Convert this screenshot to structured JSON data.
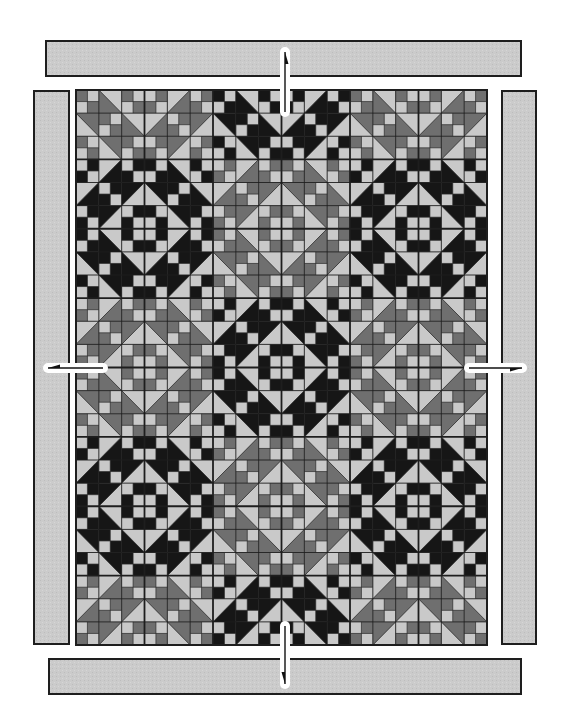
{
  "diagram": {
    "canvas": {
      "width": 575,
      "height": 725
    },
    "colors": {
      "light": "#c9c9c9",
      "medium": "#6f6f6f",
      "dark": "#161616",
      "border_fill": "#cbcbcb",
      "outline": "#1e1e1e",
      "cell_line": "#2a2a2a",
      "background": "#ffffff"
    },
    "quilt_center": {
      "x": 76,
      "y": 90,
      "width": 411,
      "height": 555,
      "blocks_across": 6,
      "blocks_down": 8,
      "cells_per_block": 6,
      "block_type": "chain block: 3x3 units of 2x2 cells; four-patches on even units, half-square triangles on odd units forming a diagonal band",
      "dark_diamond_rule": "corners with odd column index: dark when (cx in {1,5} and cy in {2,6}) or (cx = 3 and cy in {0,4,8}); otherwise medium",
      "dark_diamond_centers": [
        [
          1,
          2
        ],
        [
          5,
          2
        ],
        [
          3,
          4
        ],
        [
          1,
          6
        ],
        [
          5,
          6
        ],
        [
          3,
          0
        ],
        [
          3,
          8
        ]
      ]
    },
    "borders": [
      {
        "name": "top-border",
        "x": 46,
        "y": 41,
        "width": 475,
        "height": 35
      },
      {
        "name": "bottom-border",
        "x": 49,
        "y": 659,
        "width": 472,
        "height": 35
      },
      {
        "name": "left-border",
        "x": 34,
        "y": 91,
        "width": 35,
        "height": 553
      },
      {
        "name": "right-border",
        "x": 502,
        "y": 91,
        "width": 34,
        "height": 553
      }
    ],
    "arrows": [
      {
        "name": "arrow-top-border",
        "direction": "up",
        "x1": 285,
        "y1": 112,
        "x2": 285,
        "y2": 52
      },
      {
        "name": "arrow-bottom-border",
        "direction": "down",
        "x1": 285,
        "y1": 626,
        "x2": 285,
        "y2": 684
      },
      {
        "name": "arrow-left-border",
        "direction": "left",
        "x1": 103,
        "y1": 368,
        "x2": 48,
        "y2": 368
      },
      {
        "name": "arrow-right-border",
        "direction": "right",
        "x1": 469,
        "y1": 368,
        "x2": 522,
        "y2": 368
      }
    ]
  }
}
